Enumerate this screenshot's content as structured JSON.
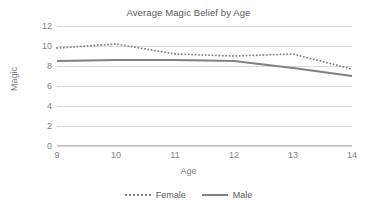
{
  "chart_data": {
    "type": "line",
    "title": "Average Magic Belief by Age",
    "xlabel": "Age",
    "ylabel": "Magic",
    "x": [
      9,
      10,
      11,
      12,
      13,
      14
    ],
    "xtick_labels": [
      "9",
      "10",
      "11",
      "12",
      "13",
      "14"
    ],
    "ytick_labels": [
      "0",
      "2",
      "4",
      "6",
      "8",
      "10",
      "12"
    ],
    "yticks": [
      0,
      2,
      4,
      6,
      8,
      10,
      12
    ],
    "ylim": [
      0,
      12
    ],
    "xlim": [
      9,
      14
    ],
    "grid": "horizontal",
    "legend_position": "bottom",
    "series": [
      {
        "name": "Female",
        "style": "dotted",
        "color": "#808080",
        "values": [
          9.8,
          10.2,
          9.2,
          9.0,
          9.2,
          7.7
        ]
      },
      {
        "name": "Male",
        "style": "solid",
        "color": "#808080",
        "values": [
          8.5,
          8.6,
          8.6,
          8.5,
          7.8,
          7.0
        ]
      }
    ]
  },
  "legend": {
    "items": [
      {
        "label": "Female"
      },
      {
        "label": "Male"
      }
    ]
  },
  "colors": {
    "series": "#808080",
    "gridline": "#d9d9d9",
    "axis": "#bfbfbf",
    "text": "#595959",
    "tick_text": "#7f7f7f",
    "background": "#ffffff"
  }
}
